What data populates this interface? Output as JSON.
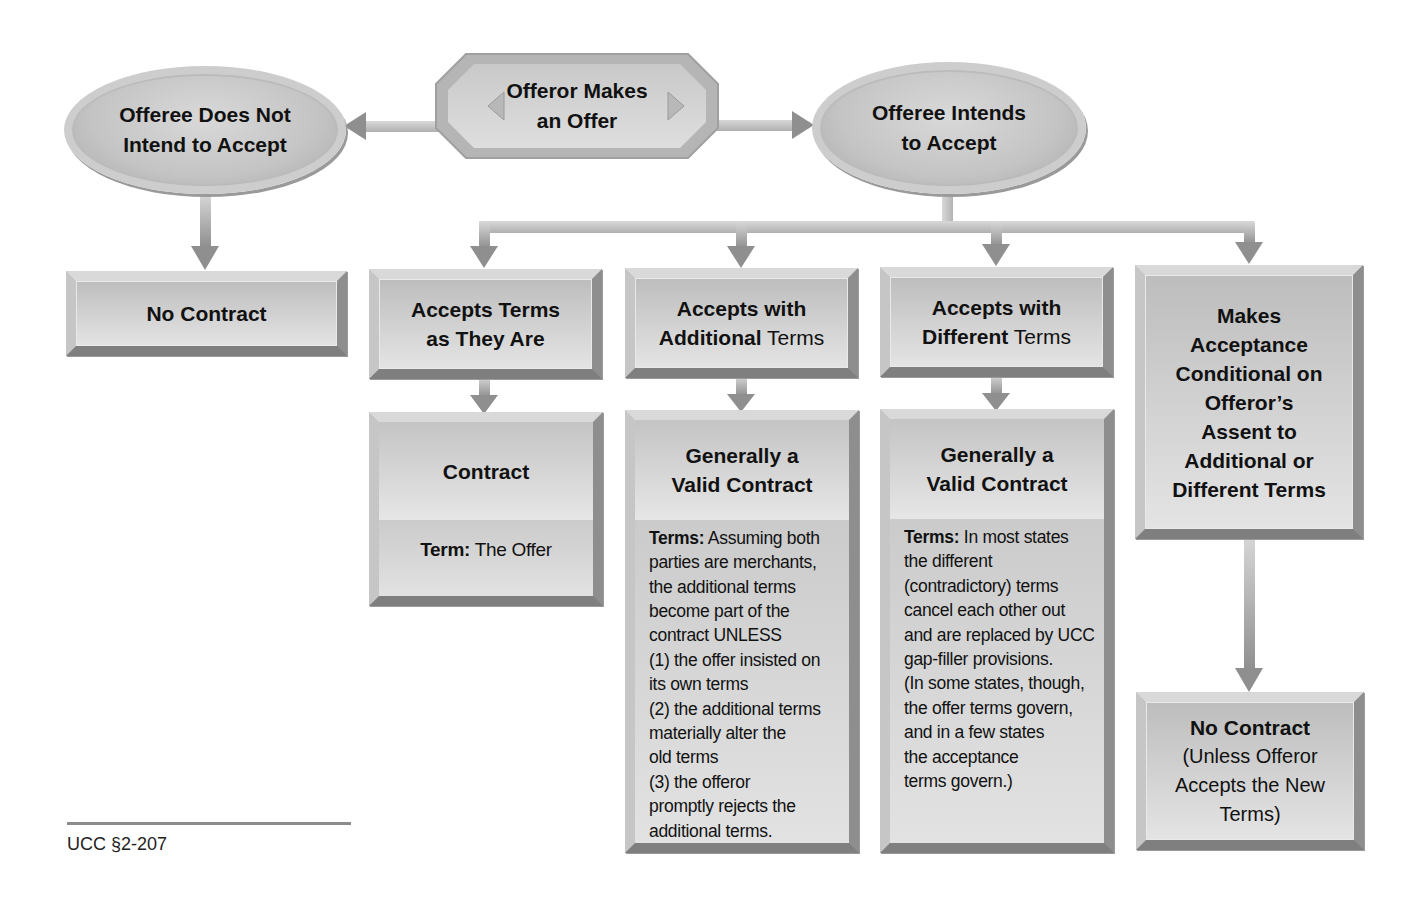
{
  "diagram": {
    "nodes": {
      "offeror": {
        "line1": "Offeror Makes",
        "line2": "an Offer"
      },
      "no_intend": {
        "line1": "Offeree Does Not",
        "line2": "Intend to Accept"
      },
      "intends": {
        "line1": "Offeree Intends",
        "line2": "to Accept"
      },
      "no_contract_left": {
        "title": "No Contract"
      },
      "accepts_as_is": {
        "line1": "Accepts Terms",
        "line2": "as They Are"
      },
      "accepts_additional": {
        "line1": "Accepts with",
        "line2_bold": "Additional",
        "line2_rest": " Terms"
      },
      "accepts_different": {
        "line1": "Accepts with",
        "line2_bold": "Different",
        "line2_rest": " Terms"
      },
      "conditional": {
        "lines": [
          "Makes",
          "Acceptance",
          "Conditional on",
          "Offeror’s",
          "Assent to",
          "Additional or",
          "Different Terms"
        ]
      },
      "contract": {
        "title": "Contract",
        "term_label": "Term:",
        "term_value": " The Offer"
      },
      "valid_additional": {
        "line1": "Generally a",
        "line2": "Valid Contract",
        "terms_label": "Terms:",
        "body_lines": [
          " Assuming both",
          "parties are merchants,",
          "the additional terms",
          "become part of the",
          "contract UNLESS",
          "(1) the offer insisted on",
          "its own terms",
          "(2) the additional terms",
          "materially alter the",
          "old terms",
          "(3) the offeror",
          "promptly rejects the",
          "additional terms."
        ]
      },
      "valid_different": {
        "line1": "Generally a",
        "line2": "Valid Contract",
        "terms_label": "Terms:",
        "body_lines": [
          " In most states",
          "the different",
          "(contradictory) terms",
          "cancel each other out",
          "and are replaced by UCC",
          "gap-filler provisions.",
          "(In some states, though,",
          "the offer terms govern,",
          "and in a few states",
          "the acceptance",
          "terms govern.)"
        ]
      },
      "no_contract_right": {
        "title": "No Contract",
        "lines": [
          "(Unless Offeror",
          "Accepts the New",
          "Terms)"
        ]
      }
    },
    "footer": {
      "citation": "UCC §2-207"
    },
    "colors": {
      "box_fill": "#cfcfcf",
      "arrow": "#8a8a8a",
      "connector": "#c8c8c8",
      "text": "#111111"
    }
  }
}
